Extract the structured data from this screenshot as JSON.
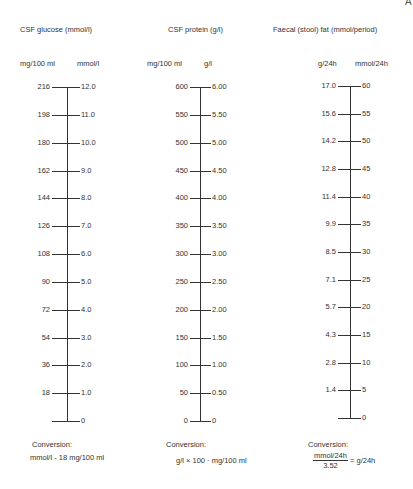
{
  "page_marker": "A",
  "chart_data": [
    {
      "type": "nomogram",
      "title": "CSF glucose (mmol/l)",
      "left_scale": {
        "label": "mg/100 ml",
        "ticks": [
          "216",
          "198",
          "180",
          "162",
          "144",
          "126",
          "108",
          "90",
          "72",
          "54",
          "36",
          "18",
          ""
        ]
      },
      "right_scale": {
        "label": "mmol/l",
        "ticks": [
          "12.0",
          "11.0",
          "10.0",
          "9.0",
          "8.0",
          "7.0",
          "6.0",
          "5.0",
          "4.0",
          "3.0",
          "2.0",
          "1.0",
          "0"
        ]
      },
      "values_mg_per_100ml": [
        216,
        198,
        180,
        162,
        144,
        126,
        108,
        90,
        72,
        54,
        36,
        18,
        0
      ],
      "values_mmol_per_l": [
        12.0,
        11.0,
        10.0,
        9.0,
        8.0,
        7.0,
        6.0,
        5.0,
        4.0,
        3.0,
        2.0,
        1.0,
        0
      ],
      "conversion": {
        "heading": "Conversion:",
        "formula": "mmol/l × 18 = mg/100 ml",
        "display": "mmol/l - 18    mg/100 ml"
      }
    },
    {
      "type": "nomogram",
      "title": "CSF protein (g/l)",
      "left_scale": {
        "label": "mg/100 ml",
        "ticks": [
          "600",
          "550",
          "500",
          "450",
          "400",
          "350",
          "300",
          "250",
          "200",
          "150",
          "100",
          "50",
          "0"
        ]
      },
      "right_scale": {
        "label": "g/l",
        "ticks": [
          "6.00",
          "5.50",
          "5.00",
          "4.50",
          "4.00",
          "3.50",
          "3.00",
          "2.50",
          "2.00",
          "1.50",
          "1.00",
          "0.50",
          "0"
        ]
      },
      "values_mg_per_100ml": [
        600,
        550,
        500,
        450,
        400,
        350,
        300,
        250,
        200,
        150,
        100,
        50,
        0
      ],
      "values_g_per_l": [
        6.0,
        5.5,
        5.0,
        4.5,
        4.0,
        3.5,
        3.0,
        2.5,
        2.0,
        1.5,
        1.0,
        0.5,
        0
      ],
      "conversion": {
        "heading": "Conversion:",
        "formula": "g/l × 100 = mg/100 ml",
        "display": "g/l × 100 · mg/100 ml"
      }
    },
    {
      "type": "nomogram",
      "title": "Faecal (stool) fat (mmol/period)",
      "left_scale": {
        "label": "g/24h",
        "ticks": [
          "17.0",
          "15.6",
          "14.2",
          "12.8",
          "11.4",
          "9.9",
          "8.5",
          "7.1",
          "5.7",
          "4.3",
          "2.8",
          "1.4",
          ""
        ]
      },
      "right_scale": {
        "label": "mmol/24h",
        "ticks": [
          "60",
          "55",
          "50",
          "45",
          "40",
          "35",
          "30",
          "25",
          "20",
          "15",
          "10",
          "5",
          "0"
        ]
      },
      "values_g_per_24h": [
        17.0,
        15.6,
        14.2,
        12.8,
        11.4,
        9.9,
        8.5,
        7.1,
        5.7,
        4.3,
        2.8,
        1.4,
        0
      ],
      "values_mmol_per_24h": [
        60,
        55,
        50,
        45,
        40,
        35,
        30,
        25,
        20,
        15,
        10,
        5,
        0
      ],
      "conversion": {
        "heading": "Conversion:",
        "numerator": "mmol/24h",
        "denominator": "3.52",
        "result": "= g/24h"
      }
    }
  ]
}
